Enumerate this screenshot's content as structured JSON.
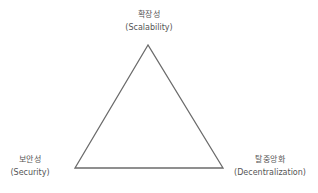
{
  "diagram": {
    "type": "triangle",
    "vertices": [
      {
        "id": "top",
        "ko": "확장성",
        "en": "(Scalability)"
      },
      {
        "id": "left",
        "ko": "보안성",
        "en": "(Security)"
      },
      {
        "id": "right",
        "ko": "탈중앙화",
        "en": "(Decentralization)"
      }
    ],
    "colors": {
      "line": "#6b6b6b",
      "text": "#555555",
      "background": "#ffffff"
    }
  }
}
